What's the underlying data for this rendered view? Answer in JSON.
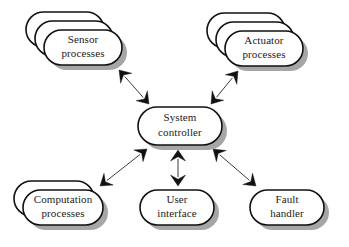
{
  "diagram": {
    "type": "block-diagram",
    "background_color": "#ffffff",
    "width": 349,
    "height": 247,
    "style": {
      "node_fill": "#ffffff",
      "node_stroke": "#111111",
      "shadow_color": "#a6a6a6",
      "edge_color": "#3a3a3a",
      "arrowhead_color": "#111111",
      "font_size_px": 11
    },
    "nodes": [
      {
        "id": "sensor-processes",
        "lines": [
          "Sensor",
          "processes"
        ],
        "shape": "stadium",
        "stack_count": 3,
        "x": 44,
        "y": 30,
        "w": 78,
        "h": 35,
        "stack_dx": -9,
        "stack_dy": -9
      },
      {
        "id": "actuator-processes",
        "lines": [
          "Actuator",
          "processes"
        ],
        "shape": "stadium",
        "stack_count": 3,
        "x": 225,
        "y": 31,
        "w": 78,
        "h": 35,
        "stack_dx": -9,
        "stack_dy": -9
      },
      {
        "id": "system-controller",
        "lines": [
          "System",
          "controller"
        ],
        "shape": "stadium",
        "stack_count": 1,
        "x": 138,
        "y": 107,
        "w": 84,
        "h": 38,
        "stack_dx": 0,
        "stack_dy": 0
      },
      {
        "id": "computation-processes",
        "lines": [
          "Computation",
          "processes"
        ],
        "shape": "stadium",
        "stack_count": 2,
        "x": 23,
        "y": 190,
        "w": 80,
        "h": 35,
        "stack_dx": -9,
        "stack_dy": -9
      },
      {
        "id": "user-interface",
        "lines": [
          "User",
          "interface"
        ],
        "shape": "stadium",
        "stack_count": 1,
        "x": 140,
        "y": 190,
        "w": 74,
        "h": 35,
        "stack_dx": 0,
        "stack_dy": 0
      },
      {
        "id": "fault-handler",
        "lines": [
          "Fault",
          "handler"
        ],
        "shape": "stadium",
        "stack_count": 1,
        "x": 250,
        "y": 190,
        "w": 74,
        "h": 35,
        "stack_dx": 0,
        "stack_dy": 0
      }
    ],
    "edges": [
      {
        "id": "controller-sensor",
        "from": "system-controller",
        "to": "sensor-processes",
        "direction": "both",
        "x1": 149,
        "y1": 104,
        "x2": 119,
        "y2": 70
      },
      {
        "id": "controller-actuator",
        "from": "system-controller",
        "to": "actuator-processes",
        "direction": "both",
        "x1": 211,
        "y1": 104,
        "x2": 238,
        "y2": 71
      },
      {
        "id": "controller-computation",
        "from": "system-controller",
        "to": "computation-processes",
        "direction": "both",
        "x1": 147,
        "y1": 149,
        "x2": 100,
        "y2": 186
      },
      {
        "id": "controller-user-interface",
        "from": "system-controller",
        "to": "user-interface",
        "direction": "both",
        "x1": 178,
        "y1": 150,
        "x2": 178,
        "y2": 186
      },
      {
        "id": "controller-fault-handler",
        "from": "system-controller",
        "to": "fault-handler",
        "direction": "both",
        "x1": 213,
        "y1": 149,
        "x2": 256,
        "y2": 186
      }
    ]
  }
}
